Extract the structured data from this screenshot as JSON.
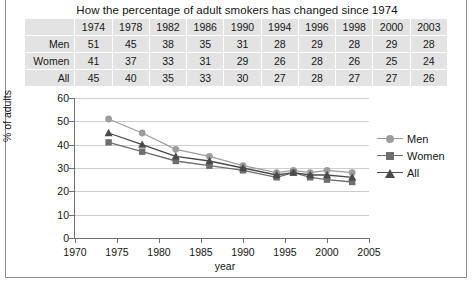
{
  "title": "How the percentage of adult smokers has changed since 1974",
  "table": {
    "corner_label": "",
    "columns": [
      "1974",
      "1978",
      "1982",
      "1986",
      "1990",
      "1994",
      "1996",
      "1998",
      "2000",
      "2003"
    ],
    "rows": [
      {
        "label": "Men",
        "values": [
          51,
          45,
          38,
          35,
          31,
          28,
          29,
          28,
          29,
          28
        ]
      },
      {
        "label": "Women",
        "values": [
          41,
          37,
          33,
          31,
          29,
          26,
          28,
          26,
          25,
          24
        ]
      },
      {
        "label": "All",
        "values": [
          45,
          40,
          35,
          33,
          30,
          27,
          28,
          27,
          27,
          26
        ]
      }
    ]
  },
  "legend": {
    "position": "right",
    "items": [
      {
        "label": "Men",
        "marker": "circle",
        "color": "#9d9d9d"
      },
      {
        "label": "Women",
        "marker": "square",
        "color": "#6e6e6e"
      },
      {
        "label": "All",
        "marker": "triangle",
        "color": "#4a4a4a"
      }
    ]
  },
  "axes": {
    "y_ticks": [
      "0",
      "10",
      "20",
      "30",
      "40",
      "50",
      "60"
    ],
    "x_ticks": [
      "1970",
      "1975",
      "1980",
      "1985",
      "1990",
      "1995",
      "2000",
      "2005"
    ],
    "y_title": "% of adults",
    "x_title": "year"
  },
  "chart_data": {
    "type": "line",
    "title": "How the percentage of adult smokers has changed since 1974",
    "xlabel": "year",
    "ylabel": "% of adults",
    "x": [
      1974,
      1978,
      1982,
      1986,
      1990,
      1994,
      1996,
      1998,
      2000,
      2003
    ],
    "categories": [
      "1974",
      "1978",
      "1982",
      "1986",
      "1990",
      "1994",
      "1996",
      "1998",
      "2000",
      "2003"
    ],
    "series": [
      {
        "name": "Men",
        "marker": "circle",
        "color": "#9d9d9d",
        "values": [
          51,
          45,
          38,
          35,
          31,
          28,
          29,
          28,
          29,
          28
        ]
      },
      {
        "name": "Women",
        "marker": "square",
        "color": "#6e6e6e",
        "values": [
          41,
          37,
          33,
          31,
          29,
          26,
          28,
          26,
          25,
          24
        ]
      },
      {
        "name": "All",
        "marker": "triangle",
        "color": "#4a4a4a",
        "values": [
          45,
          40,
          35,
          33,
          30,
          27,
          28,
          27,
          27,
          26
        ]
      }
    ],
    "xlim": [
      1970,
      2005
    ],
    "ylim": [
      0,
      60
    ],
    "ytick_step": 10,
    "xtick_step": 5,
    "grid": "horizontal",
    "legend_position": "right"
  }
}
